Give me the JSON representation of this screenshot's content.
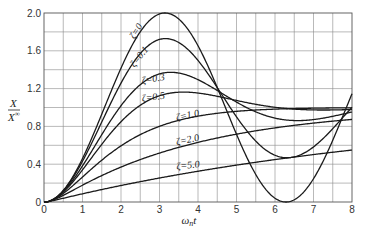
{
  "chart_data": {
    "type": "line",
    "title": "",
    "xlabel": "ωnt",
    "xlabel_main": "ω",
    "xlabel_sub": "n",
    "xlabel_tail": "t",
    "ylabel_num": "X",
    "ylabel_den": "X",
    "ylabel_den_sub": "∞",
    "ylabel": "x/x∞",
    "xlim": [
      0,
      8
    ],
    "ylim": [
      0,
      2.0
    ],
    "grid": true,
    "grid_x_step": 0.5,
    "grid_y_step": 0.2,
    "x_ticks": [
      "0",
      "1",
      "2",
      "3",
      "4",
      "5",
      "6",
      "7",
      "8"
    ],
    "y_ticks": [
      {
        "value": 0,
        "label": "0"
      },
      {
        "value": 0.4,
        "label": "0.4"
      },
      {
        "value": 0.8,
        "label": "0.8"
      },
      {
        "value": 1.2,
        "label": "1.2"
      },
      {
        "value": 1.6,
        "label": "1.6"
      },
      {
        "value": 2.0,
        "label": "2.0"
      }
    ],
    "legend": "inline curve labels",
    "series": [
      {
        "name": "ζ=0",
        "zeta": 0,
        "label": "ζ=0",
        "label_pos": [
          2.35,
          1.72
        ],
        "label_rot": -58,
        "x": [
          0,
          0.5,
          1,
          1.5,
          2,
          2.5,
          3,
          3.14,
          3.5,
          4,
          4.5,
          5,
          5.5,
          6,
          6.28,
          6.5,
          7,
          7.5,
          8
        ],
        "values": [
          0,
          0.12,
          0.46,
          0.93,
          1.42,
          1.8,
          1.99,
          2.0,
          1.94,
          1.65,
          1.21,
          0.72,
          0.29,
          0.04,
          0,
          0.02,
          0.25,
          0.65,
          1.15
        ]
      },
      {
        "name": "ζ=0.1",
        "zeta": 0.1,
        "label": "ζ=0.1",
        "label_pos": [
          2.35,
          1.42
        ],
        "label_rot": -52,
        "x": [
          0,
          0.5,
          1,
          1.5,
          2,
          2.5,
          3,
          3.16,
          3.5,
          4,
          4.5,
          5,
          5.5,
          6,
          6.5,
          7,
          7.5,
          8
        ],
        "values": [
          0,
          0.12,
          0.44,
          0.88,
          1.31,
          1.62,
          1.76,
          1.73,
          1.7,
          1.53,
          1.25,
          0.96,
          0.72,
          0.6,
          0.6,
          0.72,
          0.91,
          1.1
        ]
      },
      {
        "name": "ζ=0.3",
        "zeta": 0.3,
        "label": "ζ=0.3",
        "label_pos": [
          2.55,
          1.25
        ],
        "label_rot": -10,
        "x": [
          0,
          0.5,
          1,
          1.5,
          2,
          2.5,
          3,
          3.3,
          3.5,
          4,
          4.5,
          5,
          5.5,
          6,
          6.5,
          7,
          7.5,
          8
        ],
        "values": [
          0,
          0.11,
          0.4,
          0.75,
          1.06,
          1.27,
          1.37,
          1.37,
          1.36,
          1.3,
          1.19,
          1.07,
          0.98,
          0.92,
          0.91,
          0.93,
          0.97,
          1.01
        ]
      },
      {
        "name": "ζ=0.5",
        "zeta": 0.5,
        "label": "ζ=0.5",
        "label_pos": [
          2.55,
          1.06
        ],
        "label_rot": -8,
        "x": [
          0,
          0.5,
          1,
          1.5,
          2,
          2.5,
          3,
          3.6,
          4,
          4.5,
          5,
          5.5,
          6,
          6.5,
          7,
          7.5,
          8
        ],
        "values": [
          0,
          0.11,
          0.36,
          0.64,
          0.87,
          1.03,
          1.12,
          1.16,
          1.15,
          1.11,
          1.07,
          1.03,
          1.0,
          0.99,
          0.99,
          0.99,
          1.0
        ]
      },
      {
        "name": "ζ=1.0",
        "zeta": 1.0,
        "label": "ζ=1.0",
        "label_pos": [
          3.45,
          0.86
        ],
        "label_rot": -12,
        "x": [
          0,
          0.5,
          1,
          1.5,
          2,
          2.5,
          3,
          3.5,
          4,
          4.5,
          5,
          5.5,
          6,
          6.5,
          7,
          7.5,
          8
        ],
        "values": [
          0,
          0.09,
          0.26,
          0.44,
          0.59,
          0.71,
          0.8,
          0.86,
          0.91,
          0.94,
          0.96,
          0.97,
          0.98,
          0.99,
          0.99,
          1.0,
          1.0
        ]
      },
      {
        "name": "ζ=2.0",
        "zeta": 2.0,
        "label": "ζ=2.0",
        "label_pos": [
          3.45,
          0.6
        ],
        "label_rot": -12,
        "x": [
          0,
          0.5,
          1,
          1.5,
          2,
          2.5,
          3,
          3.5,
          4,
          4.5,
          5,
          5.5,
          6,
          6.5,
          7,
          7.5,
          8
        ],
        "values": [
          0,
          0.05,
          0.17,
          0.28,
          0.38,
          0.47,
          0.55,
          0.62,
          0.67,
          0.72,
          0.76,
          0.79,
          0.82,
          0.85,
          0.87,
          0.89,
          0.9
        ]
      },
      {
        "name": "ζ=5.0",
        "zeta": 5.0,
        "label": "ζ=5.0",
        "label_pos": [
          3.45,
          0.34
        ],
        "label_rot": -7,
        "x": [
          0,
          0.5,
          1,
          1.5,
          2,
          2.5,
          3,
          3.5,
          4,
          4.5,
          5,
          5.5,
          6,
          6.5,
          7,
          7.5,
          8
        ],
        "values": [
          0,
          0.03,
          0.08,
          0.13,
          0.18,
          0.22,
          0.26,
          0.29,
          0.33,
          0.36,
          0.39,
          0.42,
          0.45,
          0.48,
          0.5,
          0.53,
          0.55
        ]
      }
    ]
  }
}
